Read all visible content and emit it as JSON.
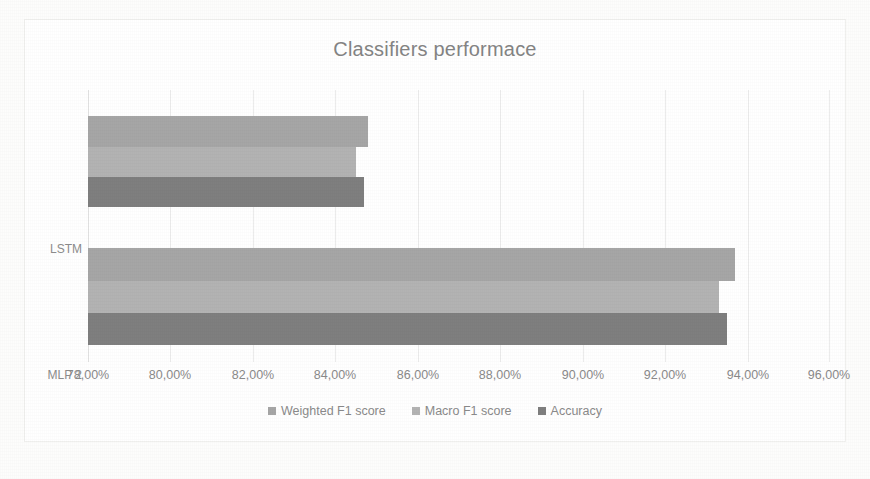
{
  "chart_data": {
    "type": "bar",
    "orientation": "horizontal",
    "title": "Classifiers performace",
    "xlabel": "",
    "ylabel": "",
    "categories": [
      "LSTM",
      "MLP 2"
    ],
    "series": [
      {
        "name": "Weighted F1 score",
        "color": "#a6a6a6",
        "values": [
          84.8,
          93.7
        ],
        "value_labels": [
          "84,80%",
          "93,70%"
        ]
      },
      {
        "name": "Macro F1 score",
        "color": "#b3b3b3",
        "values": [
          84.5,
          93.3
        ],
        "value_labels": [
          "84,50%",
          "93,30%"
        ]
      },
      {
        "name": "Accuracy",
        "color": "#7f7f7f",
        "values": [
          84.7,
          93.5
        ],
        "value_labels": [
          "84,70%",
          "93,50%"
        ]
      }
    ],
    "xlim": [
      78.0,
      96.0
    ],
    "xticks": [
      78,
      80,
      82,
      84,
      86,
      88,
      90,
      92,
      94,
      96
    ],
    "xtick_labels": [
      "78,00%",
      "80,00%",
      "82,00%",
      "84,00%",
      "86,00%",
      "88,00%",
      "90,00%",
      "92,00%",
      "94,00%",
      "96,00%"
    ],
    "grid": true,
    "grid_axis": "x",
    "legend": true,
    "legend_position": "bottom",
    "legend_entries": [
      "Weighted F1 score",
      "Macro F1 score",
      "Accuracy"
    ]
  },
  "colors": {
    "title_text": "#848484",
    "tick_text": "#8a8a8a",
    "gridline": "#ececec",
    "plot_background": "#ffffff",
    "page_background": "#fdfdfc"
  }
}
